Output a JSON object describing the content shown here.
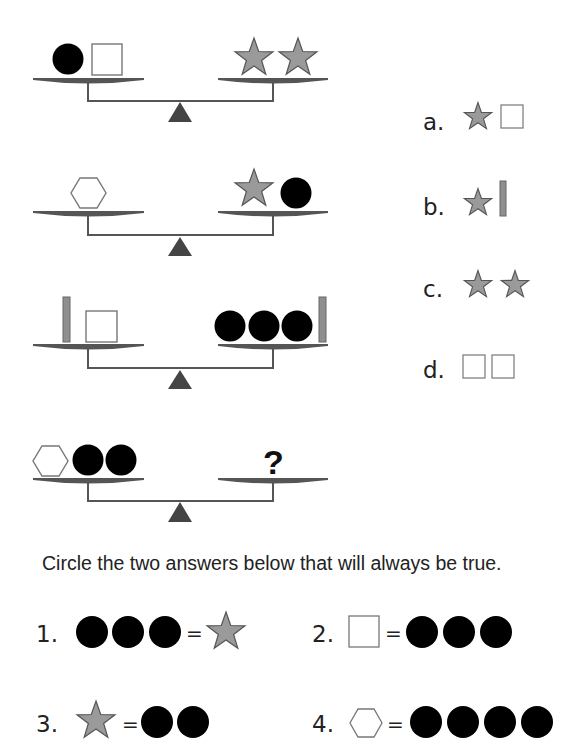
{
  "colors": {
    "circle": "#000000",
    "star_fill": "#9a9a9a",
    "star_stroke": "#555555",
    "bar_fill": "#8f8f8f",
    "outline": "#777777",
    "pan": "#555555",
    "beam": "#555555",
    "fulcrum": "#444444",
    "text": "#222222"
  },
  "scales": [
    {
      "id": 1,
      "left": [
        "circle",
        "square"
      ],
      "right": [
        "star",
        "star"
      ]
    },
    {
      "id": 2,
      "left": [
        "hexagon"
      ],
      "right": [
        "star",
        "circle"
      ]
    },
    {
      "id": 3,
      "left": [
        "bar",
        "square"
      ],
      "right": [
        "circle",
        "circle",
        "circle",
        "bar"
      ]
    },
    {
      "id": 4,
      "left": [
        "hexagon",
        "circle",
        "circle"
      ],
      "right": [
        "?"
      ]
    }
  ],
  "unknown_mark": "?",
  "options": [
    {
      "label": "a.",
      "shapes": [
        "star",
        "square"
      ]
    },
    {
      "label": "b.",
      "shapes": [
        "star",
        "bar"
      ]
    },
    {
      "label": "c.",
      "shapes": [
        "star",
        "star"
      ]
    },
    {
      "label": "d.",
      "shapes": [
        "square",
        "square"
      ]
    }
  ],
  "instruction": "Circle the two answers below that will always be true.",
  "answers": [
    {
      "label": "1.",
      "left": [
        "circle",
        "circle",
        "circle"
      ],
      "equals": "=",
      "right": [
        "star"
      ]
    },
    {
      "label": "2.",
      "left": [
        "square"
      ],
      "equals": "=",
      "right": [
        "circle",
        "circle",
        "circle"
      ]
    },
    {
      "label": "3.",
      "left": [
        "star"
      ],
      "equals": "=",
      "right": [
        "circle",
        "circle"
      ]
    },
    {
      "label": "4.",
      "left": [
        "hexagon"
      ],
      "equals": "=",
      "right": [
        "circle",
        "circle",
        "circle",
        "circle"
      ]
    }
  ]
}
